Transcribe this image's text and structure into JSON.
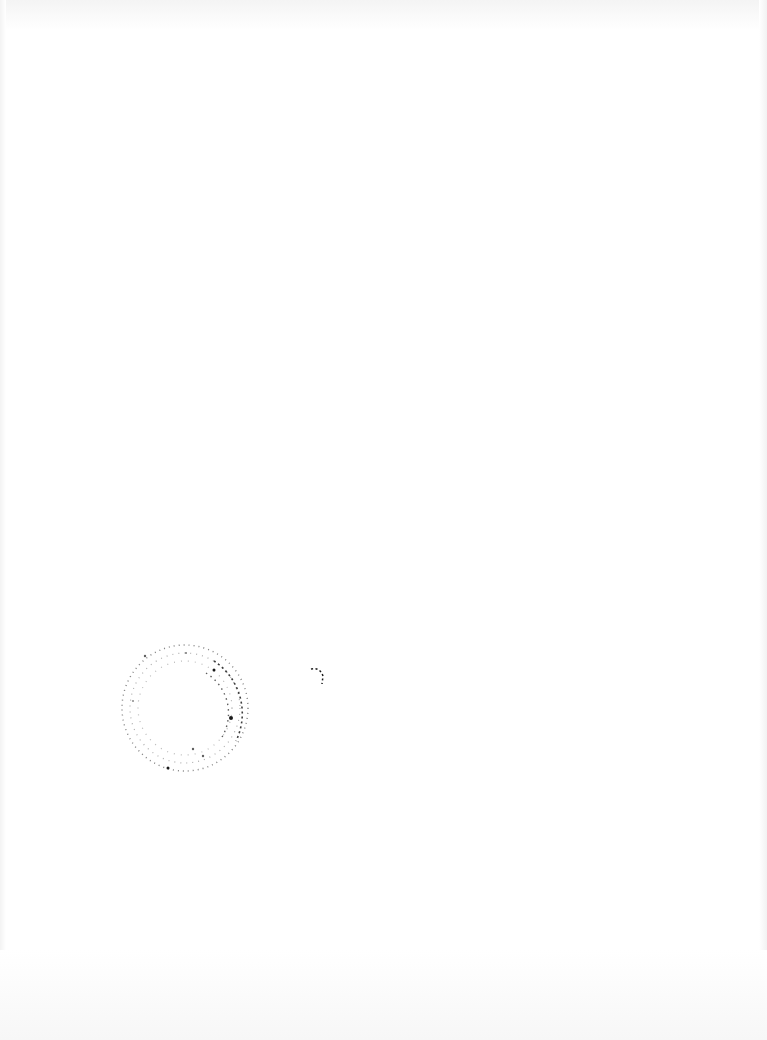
{
  "page": {
    "type": "scanned-page",
    "background_color": "#ffffff",
    "text": ""
  },
  "marks": {
    "stamp": {
      "icon": "circular-seal-icon",
      "color": "#1a1a1a",
      "legible_text": ""
    },
    "arc": {
      "icon": "arc-mark-icon",
      "color": "#1a1a1a"
    }
  }
}
